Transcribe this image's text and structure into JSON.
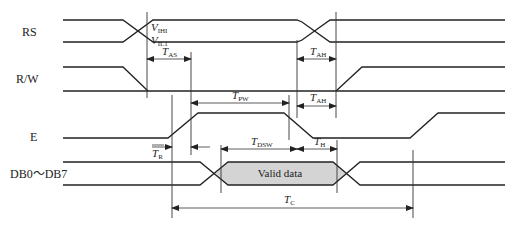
{
  "signals": [
    {
      "name": "RS"
    },
    {
      "name": "R/W"
    },
    {
      "name": "E"
    },
    {
      "name": "DB0～DB7"
    }
  ],
  "thresholds": {
    "vih": {
      "main": "V",
      "sub": "IHI"
    },
    "vil": {
      "main": "V",
      "sub": "IL1"
    }
  },
  "timing": {
    "tas": {
      "main": "T",
      "sub": "AS"
    },
    "tah1": {
      "main": "T",
      "sub": "AH"
    },
    "tah2": {
      "main": "T",
      "sub": "AH"
    },
    "tpw": {
      "main": "T",
      "sub": "PW"
    },
    "tr": {
      "main": "T",
      "sub": "R"
    },
    "tdsw": {
      "main": "T",
      "sub": "DSW"
    },
    "th": {
      "main": "T",
      "sub": "H"
    },
    "tc": {
      "main": "T",
      "sub": "C"
    }
  },
  "valid_data_label": "Valid data",
  "colors": {
    "line": "#222222",
    "valid_fill": "#d4d4d4"
  }
}
